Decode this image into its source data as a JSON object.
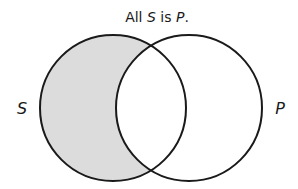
{
  "diagram": {
    "type": "venn",
    "title": {
      "prefix": "All ",
      "subject": "S",
      "middle": " is ",
      "predicate": "P",
      "suffix": "."
    },
    "circles": [
      {
        "id": "S",
        "label": "S",
        "cx": 113,
        "cy": 108,
        "r": 73
      },
      {
        "id": "P",
        "label": "P",
        "cx": 189,
        "cy": 108,
        "r": 73
      }
    ],
    "shaded_region": "S minus P",
    "colors": {
      "stroke": "#1a1a1a",
      "shade": "#dcdcdc",
      "background": "#ffffff"
    }
  }
}
